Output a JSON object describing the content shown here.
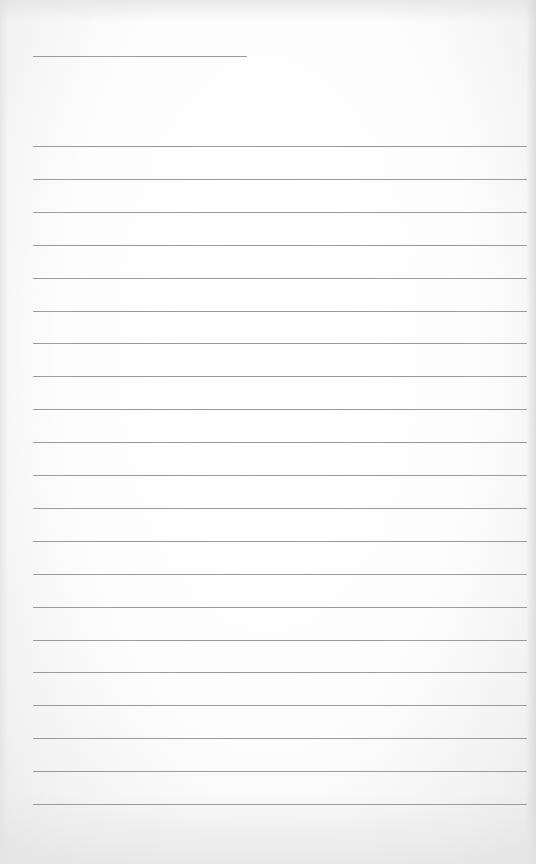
{
  "page": {
    "type": "lined-notepaper",
    "background_color": "#ffffff",
    "line_color": "#9a9a9a"
  },
  "header_line": {
    "left": 33,
    "top": 56,
    "width": 214
  },
  "rules": {
    "count": 21,
    "left": 33,
    "width": 494,
    "first_top": 146,
    "spacing": 32.9
  }
}
